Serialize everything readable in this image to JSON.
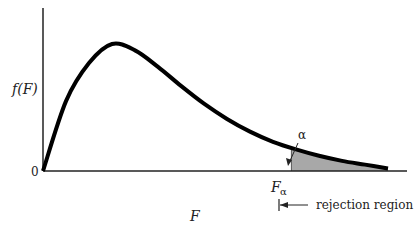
{
  "chart_data": {
    "type": "area",
    "title": "",
    "xlabel": "F",
    "ylabel": "f(F)",
    "origin_label": "0",
    "critical_value_label": "F",
    "critical_value_subscript": "α",
    "tail_area_label": "α",
    "rejection_label": "rejection region",
    "curve": {
      "distribution": "F",
      "x": [
        0,
        0.5,
        1.0,
        1.5,
        2.0,
        2.5,
        3.0,
        3.5,
        4.0,
        4.5,
        5.0,
        5.5,
        6.0,
        6.5,
        7.0,
        7.5
      ],
      "y": [
        0,
        0.55,
        0.85,
        1.0,
        0.95,
        0.82,
        0.67,
        0.53,
        0.41,
        0.31,
        0.23,
        0.17,
        0.12,
        0.08,
        0.05,
        0.02
      ]
    },
    "critical_x": 5.4,
    "shaded_region": "x >= critical_x",
    "colors": {
      "curve": "#000000",
      "shade": "#a8a8a8",
      "axis": "#222222"
    }
  }
}
